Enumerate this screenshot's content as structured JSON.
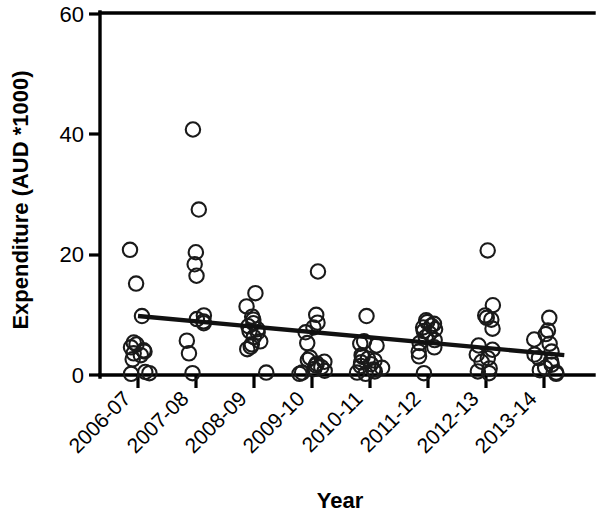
{
  "chart_data": {
    "type": "scatter",
    "title": "",
    "xlabel": "Year",
    "ylabel": "Expenditure (AUD *1000)",
    "categories": [
      "2006-07",
      "2007-08",
      "2008-09",
      "2009-10",
      "2010-11",
      "2011-12",
      "2012-13",
      "2013-14"
    ],
    "ylim": [
      0,
      60
    ],
    "yticks": [
      0,
      20,
      40,
      60
    ],
    "ytick_labels": [
      "0",
      "20",
      "40",
      "60"
    ],
    "grid": false,
    "legend": false,
    "legend_position": "none",
    "series": [
      {
        "name": "Expenditure",
        "marker": "open-circle",
        "points": [
          {
            "category": "2006-07",
            "x_index": 0,
            "values": [
              20.8,
              15.2,
              9.8,
              5.4,
              5.1,
              4.6,
              4.1,
              3.9,
              3.6,
              3.3,
              2.6,
              0.5,
              0.3,
              0.2
            ]
          },
          {
            "category": "2007-08",
            "x_index": 1,
            "values": [
              40.8,
              27.5,
              20.4,
              18.4,
              16.5,
              9.9,
              9.3,
              8.9,
              8.6,
              5.7,
              3.6,
              0.3
            ]
          },
          {
            "category": "2008-09",
            "x_index": 2,
            "values": [
              13.6,
              11.4,
              9.7,
              9.2,
              8.6,
              8.1,
              7.6,
              7.3,
              7.1,
              6.3,
              5.6,
              5.1,
              4.7,
              4.3,
              0.4
            ]
          },
          {
            "category": "2009-10",
            "x_index": 3,
            "values": [
              17.2,
              10.0,
              8.7,
              7.9,
              7.1,
              5.3,
              2.9,
              2.5,
              2.2,
              1.9,
              1.6,
              1.3,
              1.0,
              0.7,
              0.4,
              0.2
            ]
          },
          {
            "category": "2010-11",
            "x_index": 4,
            "values": [
              9.8,
              5.6,
              5.2,
              4.9,
              3.3,
              3.0,
              2.7,
              2.4,
              2.1,
              1.8,
              1.5,
              1.2,
              0.9,
              0.6,
              0.4,
              0.2
            ]
          },
          {
            "category": "2011-12",
            "x_index": 5,
            "values": [
              9.1,
              8.8,
              8.5,
              8.2,
              7.9,
              7.6,
              7.3,
              6.9,
              6.3,
              5.8,
              5.3,
              4.6,
              3.9,
              3.1,
              0.3
            ]
          },
          {
            "category": "2012-13",
            "x_index": 6,
            "values": [
              20.7,
              11.6,
              9.9,
              9.5,
              9.2,
              7.7,
              4.9,
              4.2,
              3.4,
              2.8,
              2.2,
              1.1,
              0.6,
              0.3
            ]
          },
          {
            "category": "2013-14",
            "x_index": 7,
            "values": [
              9.5,
              7.4,
              6.8,
              5.9,
              5.2,
              3.9,
              3.4,
              2.8,
              2.3,
              1.7,
              1.2,
              0.8,
              0.4,
              0.2
            ]
          }
        ]
      }
    ],
    "trend_line": {
      "type": "linear-fit",
      "start": {
        "x_index": 0,
        "y": 9.8
      },
      "end": {
        "x_index": 7.35,
        "y": 3.3
      }
    }
  }
}
